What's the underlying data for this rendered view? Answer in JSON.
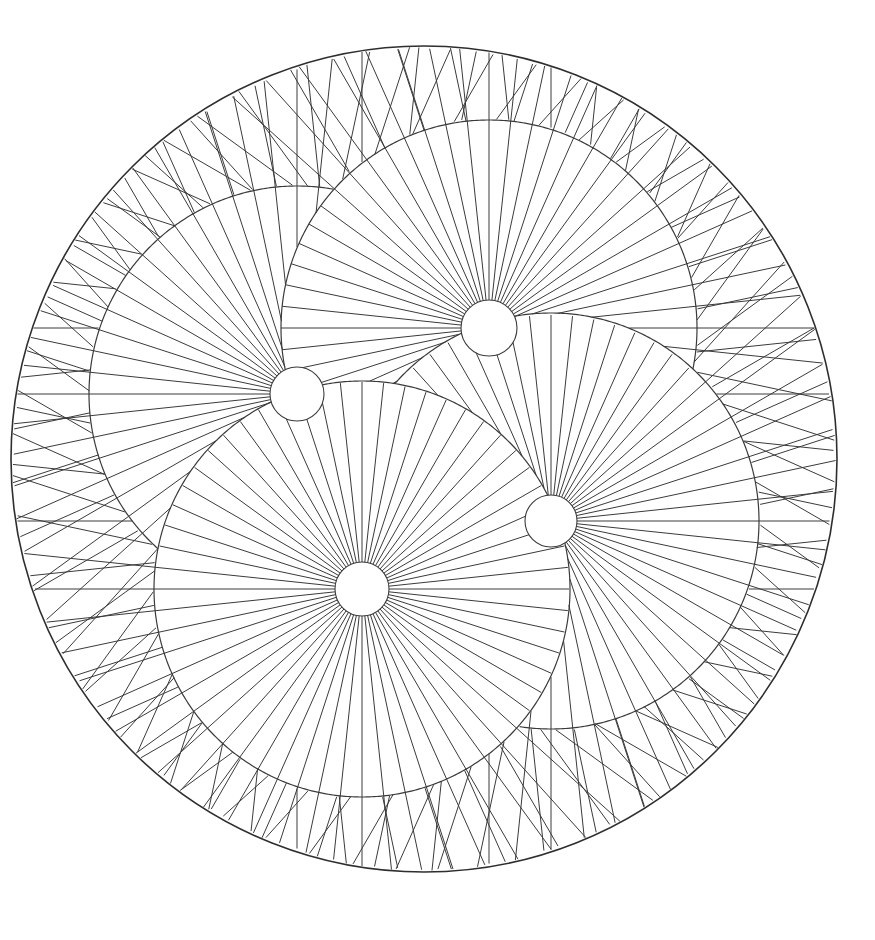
{
  "artwork": {
    "title": "Radial Sunburst Mandala",
    "kind": "geometric-line-art",
    "background_color": "#ffffff",
    "line_color": "#3a3a3a",
    "rim_color": "#2e2e2e",
    "canvas": {
      "width": 875,
      "height": 940
    }
  },
  "outer_circle": {
    "name": "outer-boundary-circle",
    "cx": 424,
    "cy": 459,
    "r": 413,
    "stroke_width": 1.6
  },
  "pattern": {
    "hub_count": 4,
    "rays_per_hub": 60,
    "symmetry": "4-fold rotational",
    "hub_orbit_radius": 131,
    "lobe_radius": 208,
    "hub_radius": 27
  },
  "hubs": [
    {
      "name": "hub-upper-left",
      "cx": 297,
      "cy": 394,
      "r": 27,
      "lobe_r": 208,
      "phase_deg": 0,
      "ray_count": 60
    },
    {
      "name": "hub-top",
      "cx": 489,
      "cy": 328,
      "r": 28,
      "lobe_r": 208,
      "phase_deg": 90,
      "ray_count": 60
    },
    {
      "name": "hub-right",
      "cx": 551,
      "cy": 521,
      "r": 26,
      "lobe_r": 208,
      "phase_deg": 180,
      "ray_count": 60
    },
    {
      "name": "hub-lower-left",
      "cx": 362,
      "cy": 589,
      "r": 27,
      "lobe_r": 208,
      "phase_deg": 270,
      "ray_count": 60
    }
  ],
  "chart_data": {
    "type": "scatter",
    "xlabel": "",
    "ylabel": "",
    "xlim": [
      0,
      875
    ],
    "ylim": [
      0,
      940
    ],
    "grid": false,
    "legend": "none",
    "series": [
      {
        "name": "hub-centers",
        "x": [
          297,
          489,
          551,
          362
        ],
        "y": [
          394,
          328,
          521,
          589
        ]
      }
    ],
    "annotations": [
      "outer boundary circle centered at (424, 459) radius 413",
      "four sunburst hubs each emitting 60 radial rays",
      "lobe arcs of radius 208 clip each sunburst region",
      "central four-pointed star void where the four lobes meet"
    ]
  }
}
